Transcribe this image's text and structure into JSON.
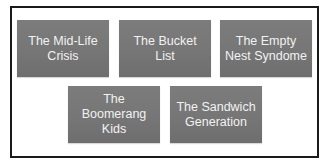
{
  "diagram": {
    "type": "grid-of-labeled-boxes",
    "rows": [
      {
        "boxes": [
          {
            "id": "mid-life-crisis",
            "label": "The Mid-Life\nCrisis"
          },
          {
            "id": "bucket-list",
            "label": "The Bucket List"
          },
          {
            "id": "empty-nest-syndome",
            "label": "The Empty\nNest Syndome"
          }
        ]
      },
      {
        "boxes": [
          {
            "id": "boomerang-kids",
            "label": "The\nBoomerang\nKids"
          },
          {
            "id": "sandwich-generation",
            "label": "The Sandwich\nGeneration"
          }
        ]
      }
    ],
    "colors": {
      "box_fill": "#767676",
      "box_text": "#f2f2f2",
      "frame_border": "#1a1a1a",
      "background": "#ffffff"
    }
  }
}
